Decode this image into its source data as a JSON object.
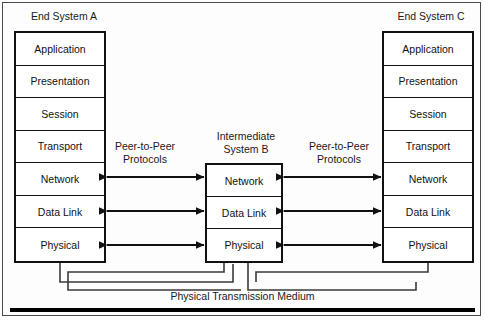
{
  "diagram": {
    "title_left": "End System A",
    "title_middle_line1": "Intermediate",
    "title_middle_line2": "System B",
    "title_right": "End System C",
    "protocols_left_line1": "Peer-to-Peer",
    "protocols_left_line2": "Protocols",
    "protocols_right_line1": "Peer-to-Peer",
    "protocols_right_line2": "Protocols",
    "medium_label": "Physical Transmission Medium",
    "end_system_layers": [
      "Application",
      "Presentation",
      "Session",
      "Transport",
      "Network",
      "Data Link",
      "Physical"
    ],
    "intermediate_layers": [
      "Network",
      "Data Link",
      "Physical"
    ],
    "colors": {
      "line": "#111111",
      "frame": "#4a4a4a",
      "text": "#1a1a1a",
      "background": "#fdfdfd",
      "medium": "#000000"
    }
  }
}
